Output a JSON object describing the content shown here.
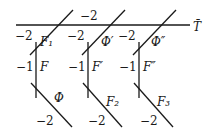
{
  "diagram": {
    "line_T": {
      "label": "T̄",
      "weight": "−2"
    },
    "groups": [
      {
        "upper_curve": {
          "label": "F₁",
          "weight": "−2"
        },
        "vertical_curve": {
          "label": "F",
          "weight": "−1"
        },
        "lower_curve": {
          "label": "Φ",
          "weight": "−2"
        }
      },
      {
        "upper_curve": {
          "label": "Φ′",
          "weight": "−2"
        },
        "vertical_curve": {
          "label": "F′",
          "weight": "−1"
        },
        "lower_curve": {
          "label": "F₂",
          "weight": "−2"
        }
      },
      {
        "upper_curve": {
          "label": "Φ″",
          "weight": "−2"
        },
        "vertical_curve": {
          "label": "F″",
          "weight": "−1"
        },
        "lower_curve": {
          "label": "F₃",
          "weight": "−2"
        }
      }
    ]
  }
}
